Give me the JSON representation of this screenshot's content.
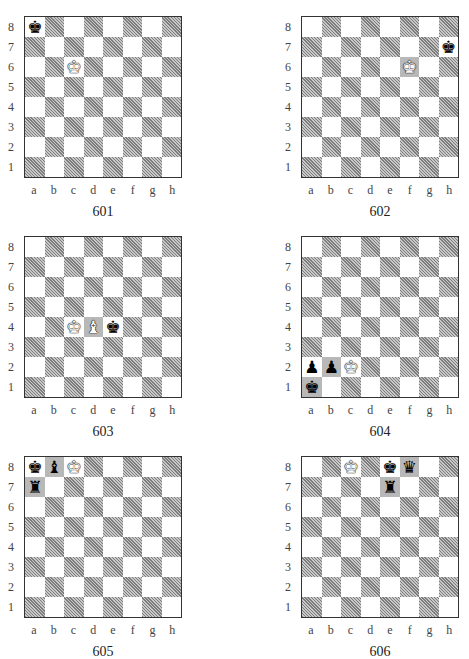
{
  "files": [
    "a",
    "b",
    "c",
    "d",
    "e",
    "f",
    "g",
    "h"
  ],
  "ranks": [
    "8",
    "7",
    "6",
    "5",
    "4",
    "3",
    "2",
    "1"
  ],
  "glyphs": {
    "K": "♚",
    "Q": "♛",
    "R": "♜",
    "B": "♝",
    "N": "♞",
    "P": "♟"
  },
  "diagrams": [
    {
      "number": "601",
      "pieces": [
        {
          "square": "a8",
          "color": "black",
          "type": "K"
        },
        {
          "square": "c6",
          "color": "white",
          "type": "K"
        }
      ]
    },
    {
      "number": "602",
      "pieces": [
        {
          "square": "h7",
          "color": "black",
          "type": "K"
        },
        {
          "square": "f6",
          "color": "white",
          "type": "K"
        }
      ]
    },
    {
      "number": "603",
      "pieces": [
        {
          "square": "c4",
          "color": "white",
          "type": "K"
        },
        {
          "square": "d4",
          "color": "white",
          "type": "B"
        },
        {
          "square": "e4",
          "color": "black",
          "type": "K"
        }
      ]
    },
    {
      "number": "604",
      "pieces": [
        {
          "square": "a2",
          "color": "black",
          "type": "P"
        },
        {
          "square": "b2",
          "color": "black",
          "type": "P"
        },
        {
          "square": "c2",
          "color": "white",
          "type": "K"
        },
        {
          "square": "a1",
          "color": "black",
          "type": "K"
        }
      ]
    },
    {
      "number": "605",
      "pieces": [
        {
          "square": "a8",
          "color": "black",
          "type": "K"
        },
        {
          "square": "b8",
          "color": "black",
          "type": "B"
        },
        {
          "square": "c8",
          "color": "white",
          "type": "K"
        },
        {
          "square": "a7",
          "color": "black",
          "type": "R"
        }
      ]
    },
    {
      "number": "606",
      "pieces": [
        {
          "square": "c8",
          "color": "white",
          "type": "K"
        },
        {
          "square": "e8",
          "color": "black",
          "type": "K"
        },
        {
          "square": "f8",
          "color": "black",
          "type": "Q"
        },
        {
          "square": "e7",
          "color": "black",
          "type": "R"
        }
      ]
    }
  ]
}
